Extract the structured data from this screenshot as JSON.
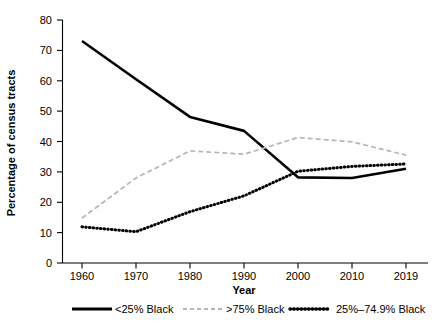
{
  "chart_data": {
    "type": "line",
    "title": "",
    "xlabel": "Year",
    "ylabel": "Percentage of census tracts",
    "x": [
      "1960",
      "1970",
      "1980",
      "1990",
      "2000",
      "2010",
      "2019"
    ],
    "xlim": [
      0,
      6
    ],
    "ylim": [
      0,
      80
    ],
    "yticks": [
      "0",
      "10",
      "20",
      "30",
      "40",
      "50",
      "60",
      "70",
      "80"
    ],
    "grid": false,
    "legend_position": "bottom",
    "series": [
      {
        "name": "<25% Black",
        "style": "solid",
        "color": "#000000",
        "values": [
          73.1,
          60.5,
          48.1,
          43.5,
          28.2,
          28.0,
          31.0
        ]
      },
      {
        "name": ">75% Black",
        "style": "dashed",
        "color": "#b5b5b5",
        "values": [
          14.8,
          28.0,
          36.9,
          35.8,
          41.3,
          39.9,
          35.5
        ]
      },
      {
        "name": "25%–74.9% Black",
        "style": "dotted",
        "color": "#000000",
        "values": [
          11.9,
          10.3,
          16.9,
          22.1,
          30.2,
          31.8,
          32.6
        ]
      }
    ]
  },
  "legend": {
    "items": [
      {
        "label": "<25% Black"
      },
      {
        "label": ">75% Black"
      },
      {
        "label": "25%–74.9% Black"
      }
    ]
  },
  "axes": {
    "x_title": "Year",
    "y_title": "Percentage of census tracts"
  }
}
